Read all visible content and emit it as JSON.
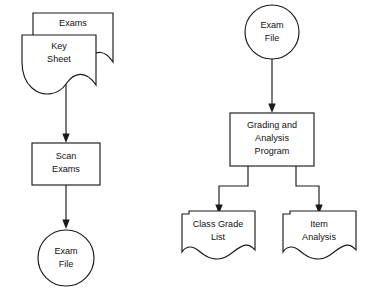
{
  "diagram": {
    "type": "flowchart",
    "background_color": "#ffffff",
    "line_color": "#1a1a1a",
    "text_color": "#111111",
    "nodes": [
      {
        "id": "exams",
        "label": "Exams",
        "lines": [
          "Exams"
        ],
        "shape": "document",
        "branch": "left"
      },
      {
        "id": "key-sheet",
        "label": "Key Sheet",
        "lines": [
          "Key",
          "Sheet"
        ],
        "shape": "document-rounded-left",
        "branch": "left"
      },
      {
        "id": "scan-exams",
        "label": "Scan Exams",
        "lines": [
          "Scan",
          "Exams"
        ],
        "shape": "process-rectangle",
        "branch": "left"
      },
      {
        "id": "exam-file-left",
        "label": "Exam File",
        "lines": [
          "Exam",
          "File"
        ],
        "shape": "circle-connector",
        "branch": "left"
      },
      {
        "id": "exam-file-right",
        "label": "Exam File",
        "lines": [
          "Exam",
          "File"
        ],
        "shape": "circle-connector",
        "branch": "right"
      },
      {
        "id": "grading-program",
        "label": "Grading and Analysis Program",
        "lines": [
          "Grading and",
          "Analysis",
          "Program"
        ],
        "shape": "process-rectangle",
        "branch": "right"
      },
      {
        "id": "class-grade-list",
        "label": "Class Grade List",
        "lines": [
          "Class Grade",
          "List"
        ],
        "shape": "document",
        "branch": "right"
      },
      {
        "id": "item-analysis",
        "label": "Item Analysis",
        "lines": [
          "Item",
          "Analysis"
        ],
        "shape": "document",
        "branch": "right"
      }
    ],
    "edges": [
      {
        "id": "edge-keysheet-to-scan",
        "from": "key-sheet",
        "to": "scan-exams",
        "style": "straight-down-arrow"
      },
      {
        "id": "edge-scan-to-examfile",
        "from": "scan-exams",
        "to": "exam-file-left",
        "style": "straight-down-arrow"
      },
      {
        "id": "edge-examfile-to-grading",
        "from": "exam-file-right",
        "to": "grading-program",
        "style": "straight-down-arrow"
      },
      {
        "id": "edge-grading-to-classgrade",
        "from": "grading-program",
        "to": "class-grade-list",
        "style": "elbow-down-left-arrow"
      },
      {
        "id": "edge-grading-to-itemanalysis",
        "from": "grading-program",
        "to": "item-analysis",
        "style": "elbow-down-right-arrow"
      }
    ]
  }
}
